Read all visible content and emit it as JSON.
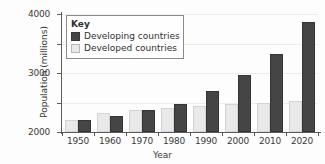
{
  "chart_data": {
    "type": "bar",
    "title": "",
    "xlabel": "Year",
    "ylabel": "Population (millions)",
    "categories": [
      "1950",
      "1960",
      "1970",
      "1980",
      "1990",
      "2000",
      "2010",
      "2020"
    ],
    "series": [
      {
        "name": "Developing countries",
        "color": "#454545",
        "values": [
          420,
          550,
          760,
          960,
          1380,
          1940,
          2660,
          3720
        ]
      },
      {
        "name": "Developed countries",
        "color": "#e9e9e9",
        "values": [
          400,
          650,
          750,
          830,
          880,
          940,
          1000,
          1060
        ]
      }
    ],
    "ylim": [
      0,
      4000
    ],
    "yticks": [
      0,
      1000,
      2000,
      3000,
      4000
    ],
    "ytick_labels": [
      "0",
      "1000",
      "2000",
      "3000",
      "4000"
    ],
    "grid": true,
    "legend_position": "top-left"
  },
  "legend": {
    "title": "Key",
    "entries": [
      {
        "label": "Developing countries",
        "color": "#454545"
      },
      {
        "label": "Developed countries",
        "color": "#e9e9e9"
      }
    ]
  }
}
